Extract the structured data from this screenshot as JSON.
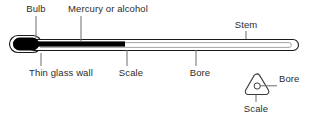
{
  "figure": {
    "background_color": "#ffffff",
    "ink_color": "#1a1a1a",
    "liquid_color": "#000000",
    "leader_color": "#6d6d6d"
  },
  "labels": {
    "bulb": "Bulb",
    "mercury_or_alcohol": "Mercury or alcohol",
    "stem": "Stem",
    "thin_glass_wall": "Thin glass wall",
    "scale": "Scale",
    "bore": "Bore"
  },
  "inset": {
    "caption_bore": "Bore",
    "caption_scale": "Scale",
    "shape": "rounded-triangle-cross-section"
  },
  "parts": [
    {
      "name": "bulb",
      "label": "Bulb",
      "position": "left-end"
    },
    {
      "name": "mercury-or-alcohol",
      "label": "Mercury or alcohol",
      "position": "liquid-column"
    },
    {
      "name": "thin-glass-wall",
      "label": "Thin glass wall",
      "position": "bulb-underside"
    },
    {
      "name": "scale",
      "label": "Scale",
      "position": "stem-lower-left"
    },
    {
      "name": "bore",
      "label": "Bore",
      "position": "stem-lower-right"
    },
    {
      "name": "stem",
      "label": "Stem",
      "position": "upper-right"
    }
  ]
}
